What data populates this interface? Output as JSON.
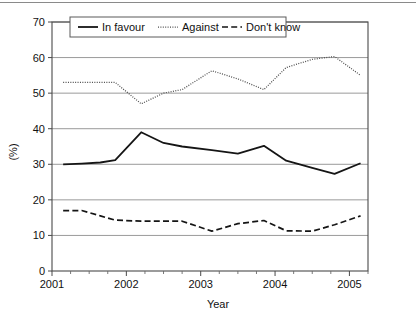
{
  "chart_data": {
    "type": "line",
    "title": "",
    "xlabel": "Year",
    "ylabel": "(%)",
    "xlim": [
      2001.0,
      2005.25
    ],
    "ylim": [
      0,
      70
    ],
    "ytick_step": 10,
    "grid": true,
    "legend_position": "top-inside",
    "x_tick_labels": [
      "2001",
      "2002",
      "2003",
      "2004",
      "2005"
    ],
    "x_tick_values": [
      2001,
      2002,
      2003,
      2004,
      2005
    ],
    "y_tick_labels": [
      "0",
      "10",
      "20",
      "30",
      "40",
      "50",
      "60",
      "70"
    ],
    "y_tick_values": [
      0,
      10,
      20,
      30,
      40,
      50,
      60,
      70
    ],
    "x": [
      2001.15,
      2001.4,
      2001.65,
      2001.85,
      2002.2,
      2002.5,
      2002.75,
      2003.15,
      2003.5,
      2003.85,
      2004.15,
      2004.5,
      2004.8,
      2005.15
    ],
    "series": [
      {
        "name": "In favour",
        "style": "solid",
        "color": "#151515",
        "values": [
          30.0,
          30.2,
          30.5,
          31.2,
          39.0,
          36.0,
          35.0,
          34.0,
          33.0,
          35.2,
          31.0,
          29.0,
          27.3,
          30.3
        ]
      },
      {
        "name": "Against",
        "style": "dotted",
        "color": "#4c4c4c",
        "values": [
          53.0,
          53.0,
          53.0,
          53.0,
          47.0,
          50.0,
          51.0,
          56.3,
          54.0,
          51.0,
          57.2,
          59.5,
          60.3,
          55.0
        ]
      },
      {
        "name": "Don't know",
        "style": "dashed",
        "color": "#151515",
        "values": [
          17.0,
          17.0,
          15.5,
          14.3,
          14.0,
          14.0,
          14.0,
          11.2,
          13.3,
          14.2,
          11.3,
          11.2,
          13.0,
          15.5
        ]
      }
    ]
  },
  "legend": {
    "items": [
      {
        "label": "In favour"
      },
      {
        "label": "Against"
      },
      {
        "label": "Don't know"
      }
    ]
  },
  "axes": {
    "y_title": "(%)",
    "x_title": "Year"
  }
}
